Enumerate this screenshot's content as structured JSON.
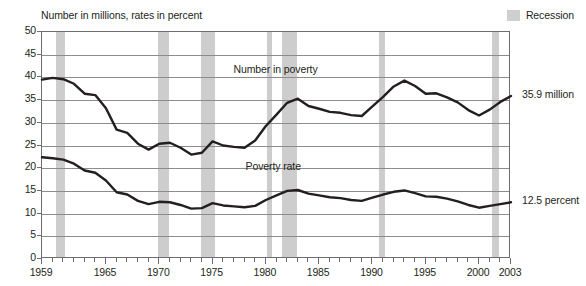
{
  "chart_data": {
    "type": "line",
    "title": "Number in millions, rates in percent",
    "xlabel": "",
    "ylabel": "",
    "xlim": [
      1959,
      2003
    ],
    "ylim": [
      0,
      50
    ],
    "grid": true,
    "legend_position": "top-right",
    "y_ticks": [
      "0",
      "5",
      "10",
      "15",
      "20",
      "25",
      "30",
      "35",
      "40",
      "45",
      "50"
    ],
    "x_ticks": [
      "1959",
      "1965",
      "1970",
      "1975",
      "1980",
      "1985",
      "1990",
      "1995",
      "2000",
      "2003"
    ],
    "legend": [
      {
        "label": "Recession",
        "color": "#cdcdcd",
        "kind": "band"
      }
    ],
    "annotations": [
      {
        "text": "Number in poverty",
        "series": "Number in poverty",
        "x": 1981,
        "y": 41.5
      },
      {
        "text": "Poverty rate",
        "series": "Poverty rate",
        "x": 1981,
        "y": 20.0
      },
      {
        "text": "35.9 million",
        "series": "Number in poverty",
        "x": 2003,
        "y": 35.9,
        "placement": "right"
      },
      {
        "text": "12.5 percent",
        "series": "Poverty rate",
        "x": 2003,
        "y": 12.5,
        "placement": "right"
      }
    ],
    "recessions": [
      {
        "start": 1960.3,
        "end": 1961.2
      },
      {
        "start": 1969.9,
        "end": 1970.9
      },
      {
        "start": 1973.9,
        "end": 1975.2
      },
      {
        "start": 1980.1,
        "end": 1980.6
      },
      {
        "start": 1981.5,
        "end": 1982.9
      },
      {
        "start": 1990.6,
        "end": 1991.2
      },
      {
        "start": 2001.2,
        "end": 2001.9
      }
    ],
    "x": [
      1959,
      1960,
      1961,
      1962,
      1963,
      1964,
      1965,
      1966,
      1967,
      1968,
      1969,
      1970,
      1971,
      1972,
      1973,
      1974,
      1975,
      1976,
      1977,
      1978,
      1979,
      1980,
      1981,
      1982,
      1983,
      1984,
      1985,
      1986,
      1987,
      1988,
      1989,
      1990,
      1991,
      1992,
      1993,
      1994,
      1995,
      1996,
      1997,
      1998,
      1999,
      2000,
      2001,
      2002,
      2003
    ],
    "series": [
      {
        "name": "Number in poverty",
        "unit": "millions",
        "end_value": 35.9,
        "end_label": "35.9 million",
        "values": [
          39.5,
          39.9,
          39.6,
          38.6,
          36.4,
          36.1,
          33.2,
          28.5,
          27.8,
          25.4,
          24.1,
          25.4,
          25.6,
          24.5,
          23.0,
          23.4,
          25.9,
          25.0,
          24.7,
          24.5,
          26.1,
          29.3,
          31.8,
          34.4,
          35.3,
          33.7,
          33.1,
          32.4,
          32.2,
          31.7,
          31.5,
          33.6,
          35.7,
          38.0,
          39.3,
          38.1,
          36.4,
          36.5,
          35.6,
          34.5,
          32.8,
          31.6,
          32.9,
          34.6,
          35.9
        ]
      },
      {
        "name": "Poverty rate",
        "unit": "percent",
        "end_value": 12.5,
        "end_label": "12.5 percent",
        "values": [
          22.4,
          22.2,
          21.9,
          21.0,
          19.5,
          19.0,
          17.3,
          14.7,
          14.2,
          12.8,
          12.1,
          12.6,
          12.5,
          11.9,
          11.1,
          11.2,
          12.3,
          11.8,
          11.6,
          11.4,
          11.7,
          13.0,
          14.0,
          15.0,
          15.2,
          14.4,
          14.0,
          13.6,
          13.4,
          13.0,
          12.8,
          13.5,
          14.2,
          14.8,
          15.1,
          14.5,
          13.8,
          13.7,
          13.3,
          12.7,
          11.9,
          11.3,
          11.7,
          12.1,
          12.5
        ]
      }
    ]
  }
}
